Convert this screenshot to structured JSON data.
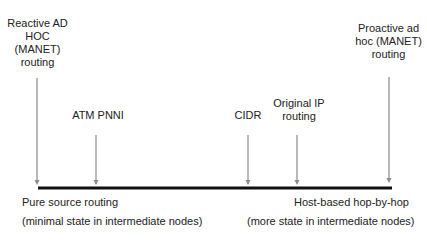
{
  "diagram": {
    "type": "spectrum",
    "colors": {
      "axis": "#111111",
      "arrow": "#8a8a8a",
      "text": "#222222"
    },
    "markers": [
      {
        "id": "reactive-adhoc",
        "lines": [
          "Reactive AD",
          "HOC",
          "(MANET)",
          "routing"
        ],
        "x": 37,
        "arrow_top": 78
      },
      {
        "id": "atm-pnni",
        "lines": [
          "ATM PNNI"
        ],
        "x": 96,
        "arrow_top": 135
      },
      {
        "id": "cidr",
        "lines": [
          "CIDR"
        ],
        "x": 248,
        "arrow_top": 135
      },
      {
        "id": "original-ip",
        "lines": [
          "Original IP",
          "routing"
        ],
        "x": 297,
        "arrow_top": 135
      },
      {
        "id": "proactive-adhoc",
        "lines": [
          "Proactive ad",
          "hoc (MANET)",
          "routing"
        ],
        "x": 389,
        "arrow_top": 77
      }
    ],
    "left_end": {
      "title": "Pure source routing",
      "subtitle": "(minimal state in intermediate nodes)"
    },
    "right_end": {
      "title": "Host-based hop-by-hop",
      "subtitle": "(more state in intermediate nodes)"
    }
  }
}
